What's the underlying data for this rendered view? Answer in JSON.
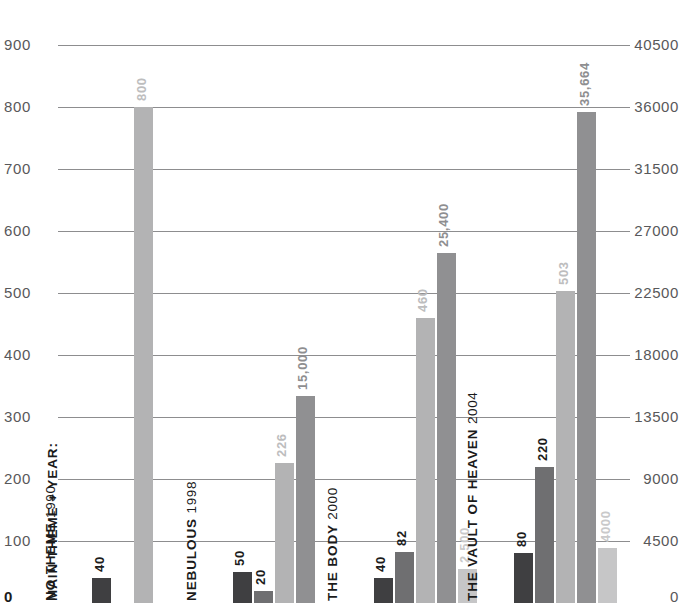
{
  "chart_data": {
    "type": "bar",
    "title": "",
    "subtitle": "",
    "xlabel": "MAIN THEME + YEAR:",
    "ylabel": "",
    "grid": true,
    "legend_position": "none",
    "categories": [
      "NO THEME 1990",
      "NEBULOUS 1998",
      "THE BODY 2000",
      "THE VAULT OF HEAVEN 2004"
    ],
    "category_names": [
      "NO THEME",
      "NEBULOUS",
      "THE BODY",
      "THE VAULT OF HEAVEN"
    ],
    "category_years": [
      "1990",
      "1998",
      "2000",
      "2004"
    ],
    "left_axis": {
      "ticks": [
        "0",
        "100",
        "200",
        "300",
        "400",
        "500",
        "600",
        "700",
        "800",
        "900"
      ],
      "min": 0,
      "max": 900
    },
    "right_axis": {
      "ticks": [
        "0",
        "4500",
        "9000",
        "13500",
        "18000",
        "22500",
        "27000",
        "31500",
        "36000",
        "40500"
      ],
      "min": 0,
      "max": 40500
    },
    "series": [
      {
        "name": "series-1",
        "axis": "left",
        "color": "#3f3f41",
        "values": [
          40,
          50,
          40,
          80
        ],
        "labels": [
          "40",
          "50",
          "40",
          "80"
        ],
        "label_colors": [
          "#1b1b1b",
          "#1b1b1b",
          "#1b1b1b",
          "#1b1b1b"
        ]
      },
      {
        "name": "series-2",
        "axis": "left",
        "color": "#6f6f71",
        "values": [
          null,
          20,
          82,
          220
        ],
        "labels": [
          "",
          "20",
          "82",
          "220"
        ],
        "label_colors": [
          "",
          "#1b1b1b",
          "#1b1b1b",
          "#1b1b1b"
        ]
      },
      {
        "name": "series-3",
        "axis": "left",
        "color": "#b3b3b4",
        "values": [
          800,
          226,
          460,
          503
        ],
        "labels": [
          "800",
          "226",
          "460",
          "503"
        ],
        "label_colors": [
          "#bdbdbe",
          "#bdbdbe",
          "#bdbdbe",
          "#bdbdbe"
        ]
      },
      {
        "name": "series-4",
        "axis": "right",
        "color": "#909092",
        "values": [
          null,
          15000,
          25400,
          35664
        ],
        "labels": [
          "",
          "15,000",
          "25,400",
          "35,664"
        ],
        "label_colors": [
          "",
          "#8e8e90",
          "#8e8e90",
          "#8e8e90"
        ]
      },
      {
        "name": "series-5",
        "axis": "right",
        "color": "#c6c6c7",
        "values": [
          null,
          null,
          2500,
          4000
        ],
        "labels": [
          "",
          "",
          "2,500",
          "4000"
        ],
        "label_colors": [
          "",
          "",
          "#c9c9ca",
          "#c9c9ca"
        ]
      }
    ]
  },
  "colors": {
    "background": "#ffffff",
    "gridline": "#8d8d8f",
    "axis_text": "#58585a",
    "category_text": "#1b1b1b"
  }
}
